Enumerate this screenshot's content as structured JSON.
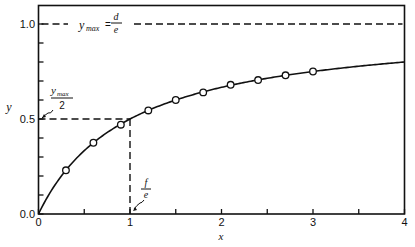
{
  "chart_data": {
    "type": "line",
    "title": "",
    "xlabel": "x",
    "ylabel": "y",
    "xlim": [
      0,
      4
    ],
    "ylim": [
      0,
      1.0
    ],
    "x_ticks": [
      "0",
      "1",
      "2",
      "3",
      "4"
    ],
    "x_minor_step": 0.5,
    "y_ticks": [
      "0.0",
      "0.5",
      "1.0"
    ],
    "y_minor_step": 0.1,
    "grid": false,
    "legend": null,
    "series": [
      {
        "name": "curve",
        "style": "solid",
        "function": "y = x / (1 + x)",
        "x": [
          0,
          0.25,
          0.5,
          0.75,
          1.0,
          1.5,
          2.0,
          2.5,
          3.0,
          3.5,
          4.0
        ],
        "y": [
          0,
          0.2,
          0.333,
          0.429,
          0.5,
          0.6,
          0.667,
          0.714,
          0.75,
          0.778,
          0.8
        ]
      },
      {
        "name": "data points",
        "style": "open-circle",
        "x": [
          0.3,
          0.6,
          0.9,
          1.2,
          1.5,
          1.8,
          2.1,
          2.4,
          2.7,
          3.0
        ],
        "y": [
          0.23,
          0.375,
          0.47,
          0.545,
          0.6,
          0.64,
          0.68,
          0.705,
          0.73,
          0.75
        ]
      }
    ],
    "annotations": [
      {
        "text": "y_max = d/e",
        "type": "horizontal-dashed-line",
        "y": 1.0
      },
      {
        "text": "y_max / 2",
        "type": "horizontal-dashed-line",
        "y": 0.5,
        "x_range": [
          0,
          1
        ]
      },
      {
        "text": "f / e",
        "type": "vertical-dashed-line",
        "x": 1.0,
        "y_range": [
          0,
          0.5
        ]
      }
    ]
  },
  "labels": {
    "x_axis": "x",
    "y_axis": "y",
    "ymax_prefix": "y",
    "ymax_sub": "max",
    "ymax_eq": "=",
    "ymax_num": "d",
    "ymax_den": "e",
    "half_num_y": "y",
    "half_num_sub": "max",
    "half_den": "2",
    "fe_num": "f",
    "fe_den": "e"
  }
}
